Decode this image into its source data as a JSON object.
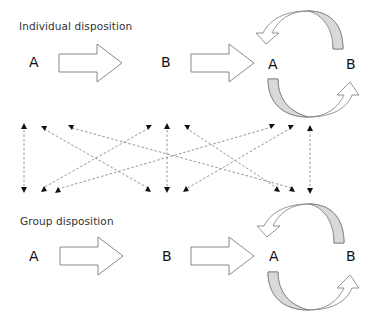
{
  "diagram": {
    "top_group": {
      "title": "Individual disposition",
      "left_A": "A",
      "middle_B": "B",
      "cycle_A": "A",
      "cycle_B": "B"
    },
    "bottom_group": {
      "title": "Group disposition",
      "left_A": "A",
      "middle_B": "B",
      "cycle_A": "A",
      "cycle_B": "B"
    },
    "colors": {
      "outline": "#7a7a7a",
      "fill_shaded": "#d9d9d9",
      "dashed": "#8a8a8a",
      "arrowhead": "#111111"
    }
  }
}
